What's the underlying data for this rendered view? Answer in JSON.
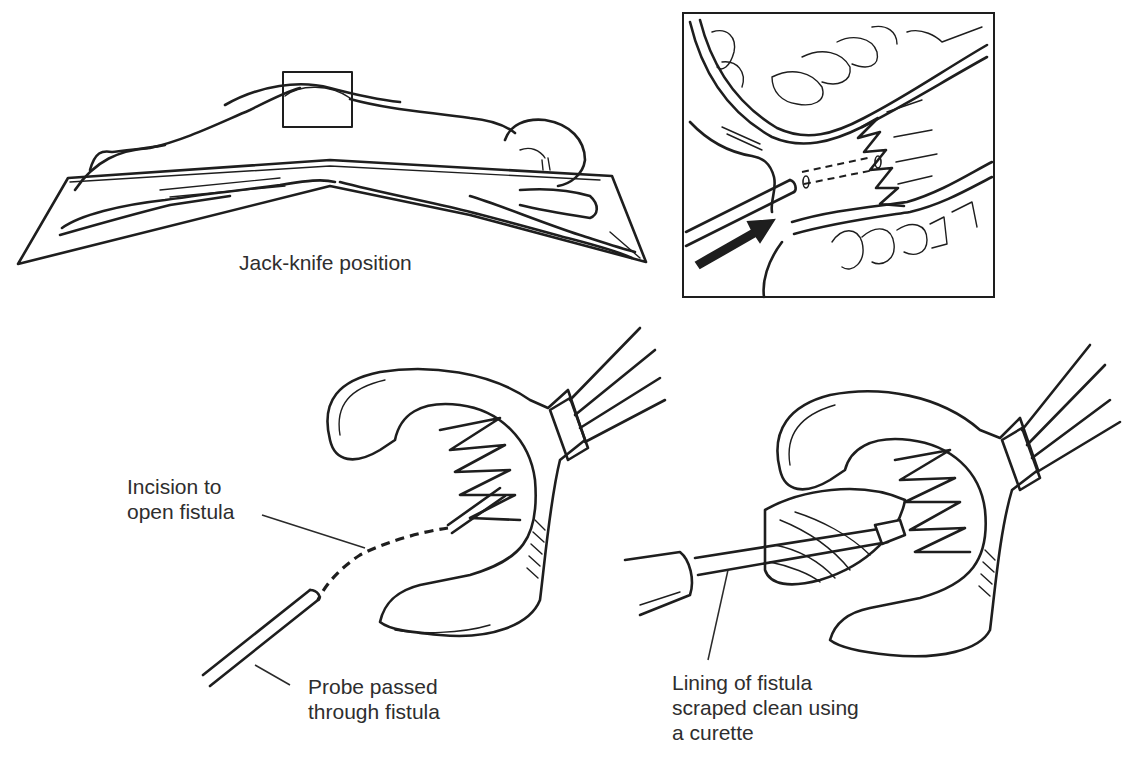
{
  "figure": {
    "panels": [
      {
        "id": "jack-knife",
        "caption": "Jack-knife position",
        "description": "Patient lying prone on a table flexed at the hips; a rectangle highlights the perianal region"
      },
      {
        "id": "inset",
        "description": "Close-up cross-section of anal canal showing probe (arrow) entering the fistula tract (dashed lines)"
      },
      {
        "id": "probe-step",
        "labels": {
          "incision": "Incision to\nopen fistula",
          "probe": "Probe passed\nthrough fistula"
        }
      },
      {
        "id": "curette-step",
        "labels": {
          "lining": "Lining of fistula\nscraped clean using\na curette"
        }
      }
    ],
    "colors": {
      "ink": "#1e1e1e",
      "text": "#2e2e2e",
      "background": "#ffffff"
    }
  }
}
